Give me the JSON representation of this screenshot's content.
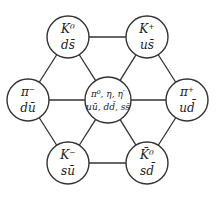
{
  "diagram": {
    "colors": {
      "stroke": "#333333",
      "text": "#222222",
      "background": "#ffffff"
    },
    "nodes": [
      {
        "id": "K0",
        "particle": "K⁰",
        "quarks": "ds̄",
        "cx": 68,
        "cy": 37,
        "r": 21
      },
      {
        "id": "Kplus",
        "particle": "K⁺",
        "quarks": "us̄",
        "cx": 147,
        "cy": 37,
        "r": 21
      },
      {
        "id": "piminus",
        "particle": "π⁻",
        "quarks": "dū",
        "cx": 28,
        "cy": 100,
        "r": 21
      },
      {
        "id": "center",
        "particle": "π⁰, η, η′",
        "quarks": "uū, dd̄, ss̄",
        "cx": 108,
        "cy": 100,
        "r": 23
      },
      {
        "id": "piplus",
        "particle": "π⁺",
        "quarks": "ud̄",
        "cx": 187,
        "cy": 100,
        "r": 21
      },
      {
        "id": "Kminus",
        "particle": "K⁻",
        "quarks": "sū",
        "cx": 68,
        "cy": 163,
        "r": 21
      },
      {
        "id": "K0bar",
        "particle": "K̄⁰",
        "quarks": "sd̄",
        "cx": 147,
        "cy": 163,
        "r": 21
      }
    ],
    "edges": [
      [
        "K0",
        "Kplus"
      ],
      [
        "Kplus",
        "piplus"
      ],
      [
        "piplus",
        "K0bar"
      ],
      [
        "K0bar",
        "Kminus"
      ],
      [
        "Kminus",
        "piminus"
      ],
      [
        "piminus",
        "K0"
      ],
      [
        "center",
        "K0"
      ],
      [
        "center",
        "Kplus"
      ],
      [
        "center",
        "piplus"
      ],
      [
        "center",
        "K0bar"
      ],
      [
        "center",
        "Kminus"
      ],
      [
        "center",
        "piminus"
      ]
    ]
  }
}
